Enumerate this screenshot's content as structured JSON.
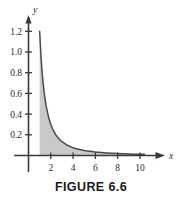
{
  "figure": {
    "caption": "FIGURE 6.6"
  },
  "chart_data": {
    "type": "area",
    "title": "",
    "xlabel": "x",
    "ylabel": "y",
    "xlim": [
      0,
      10.6
    ],
    "ylim": [
      0,
      1.3
    ],
    "grid": false,
    "legend": false,
    "x_ticks": [
      2,
      4,
      6,
      8,
      10
    ],
    "x_tick_labels": [
      "2",
      "4",
      "6",
      "8",
      "10"
    ],
    "y_ticks": [
      0.2,
      0.4,
      0.6,
      0.8,
      1.0,
      1.2
    ],
    "y_tick_labels": [
      "0.2",
      "0.4",
      "0.6",
      "0.8",
      "1.0",
      "1.2"
    ],
    "curve_label": "y = 1.2/x^2",
    "shaded_region": {
      "fill_color": "#c9c9c9",
      "x_start": 1,
      "x_end": 10.4
    },
    "curve_color": "#4a4a4a",
    "axis_color": "#3a3a3a",
    "x": [
      1.0,
      1.1,
      1.2,
      1.3,
      1.4,
      1.5,
      1.6,
      1.8,
      2.0,
      2.2,
      2.4,
      2.6,
      2.8,
      3.0,
      3.4,
      3.8,
      4.2,
      4.6,
      5.0,
      5.5,
      6.0,
      6.5,
      7.0,
      7.5,
      8.0,
      8.5,
      9.0,
      9.5,
      10.0,
      10.4
    ],
    "y": [
      1.2,
      0.992,
      0.833,
      0.71,
      0.612,
      0.533,
      0.469,
      0.37,
      0.3,
      0.248,
      0.208,
      0.178,
      0.153,
      0.133,
      0.104,
      0.083,
      0.068,
      0.057,
      0.048,
      0.04,
      0.033,
      0.028,
      0.024,
      0.021,
      0.019,
      0.017,
      0.015,
      0.013,
      0.012,
      0.011
    ]
  }
}
